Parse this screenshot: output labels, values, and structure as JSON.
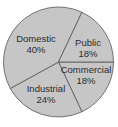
{
  "chart_data": {
    "type": "pie",
    "title": "",
    "categories": [
      "Commercial",
      "Industrial",
      "Domestic",
      "Public"
    ],
    "values": [
      18,
      24,
      40,
      18
    ],
    "unit": "%",
    "labels": [
      {
        "name": "Commercial",
        "pct": "18%"
      },
      {
        "name": "Industrial",
        "pct": "24%"
      },
      {
        "name": "Domestic",
        "pct": "40%"
      },
      {
        "name": "Public",
        "pct": "18%"
      }
    ],
    "fill_color": "#c6c6c6",
    "stroke_color": "#555555",
    "legend": "none (labels inside slices)"
  }
}
